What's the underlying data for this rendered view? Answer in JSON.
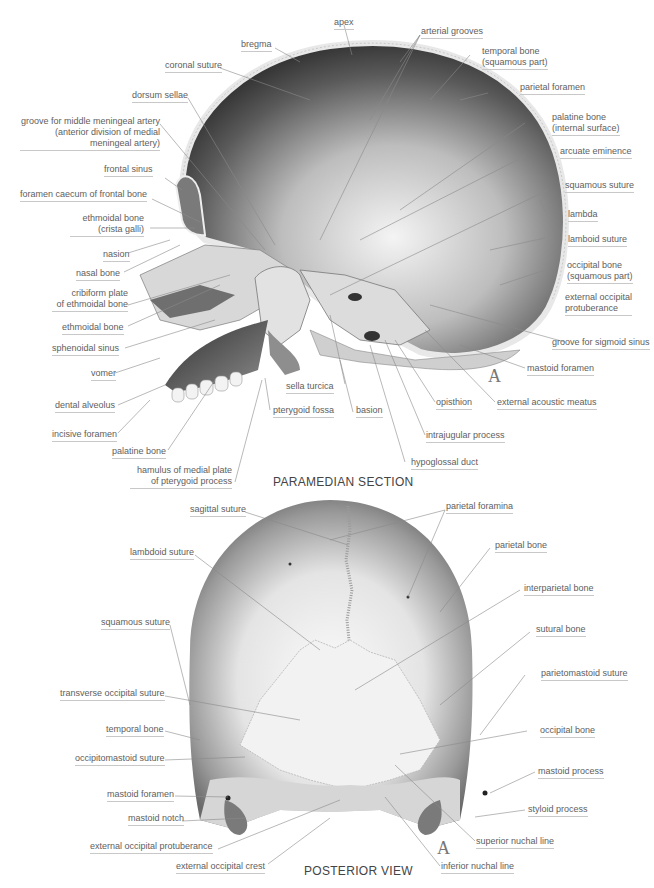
{
  "figure": {
    "paramedian": {
      "title": "PARAMEDIAN SECTION",
      "mark": "A",
      "labels": {
        "apex": "apex",
        "bregma": "bregma",
        "arterial_grooves": "arterial grooves",
        "coronal_suture": "coronal suture",
        "temporal_bone_1": "temporal bone",
        "temporal_bone_2": "(squamous part)",
        "parietal_foramen": "parietal foramen",
        "dorsum_sellae": "dorsum sellae",
        "groove_mma_1": "groove for middle meningeal artery",
        "groove_mma_2": "(anterior division of medial",
        "groove_mma_3": "meningeal artery)",
        "palatine_internal_1": "palatine bone",
        "palatine_internal_2": "(internal surface)",
        "arcuate_eminence": "arcuate eminence",
        "frontal_sinus": "frontal sinus",
        "foramen_caecum": "foramen caecum of frontal bone",
        "squamous_suture": "squamous suture",
        "ethmoidal_crista_1": "ethmoidal bone",
        "ethmoidal_crista_2": "(crista galli)",
        "lambda": "lambda",
        "lamboid_suture": "lamboid suture",
        "nasion": "nasion",
        "nasal_bone": "nasal bone",
        "occipital_squamous_1": "occipital bone",
        "occipital_squamous_2": "(squamous part)",
        "cribiform_1": "cribiform plate",
        "cribiform_2": "of ethmoidal bone",
        "ext_occ_prot_1": "external occipital",
        "ext_occ_prot_2": "protuberance",
        "ethmoidal_bone": "ethmoidal bone",
        "sphenoidal_sinus": "sphenoidal sinus",
        "groove_sigmoid": "groove for sigmoid sinus",
        "vomer": "vomer",
        "mastoid_foramen": "mastoid foramen",
        "sella_turcica": "sella turcica",
        "dental_alveolus": "dental alveolus",
        "pterygoid_fossa": "pterygoid fossa",
        "basion": "basion",
        "opisthion": "opisthion",
        "ext_acoustic_meatus": "external acoustic meatus",
        "incisive_foramen": "incisive foramen",
        "intrajugular_process": "intrajugular process",
        "palatine_bone": "palatine bone",
        "hypoglossal_duct": "hypoglossal duct",
        "hamulus_1": "hamulus of medial plate",
        "hamulus_2": "of pterygoid process"
      }
    },
    "posterior": {
      "title": "POSTERIOR VIEW",
      "mark": "A",
      "labels": {
        "sagittal_suture": "sagittal suture",
        "parietal_foramina": "parietal foramina",
        "parietal_bone": "parietal bone",
        "lambdoid_suture": "lambdoid suture",
        "interparietal_bone": "interparietal bone",
        "squamous_suture": "squamous suture",
        "sutural_bone": "sutural bone",
        "parietomastoid_suture": "parietomastoid suture",
        "transverse_occipital_suture": "transverse occipital suture",
        "temporal_bone": "temporal bone",
        "occipital_bone": "occipital bone",
        "occipitomastoid_suture": "occipitomastoid suture",
        "mastoid_process": "mastoid process",
        "mastoid_foramen": "mastoid foramen",
        "styloid_process": "styloid process",
        "mastoid_notch": "mastoid notch",
        "superior_nuchal_line": "superior nuchal line",
        "external_occipital_protuberance": "external occipital protuberance",
        "external_occipital_crest": "external occipital crest",
        "inferior_nuchal_line": "inferior nuchal line"
      }
    }
  },
  "colors": {
    "label_text": "#5e5e5e",
    "leader_line": "#8a8a8a",
    "underline": "#c8c8c8",
    "bone_dark": "#3a3a3a",
    "bone_light": "#e6e6e6"
  }
}
